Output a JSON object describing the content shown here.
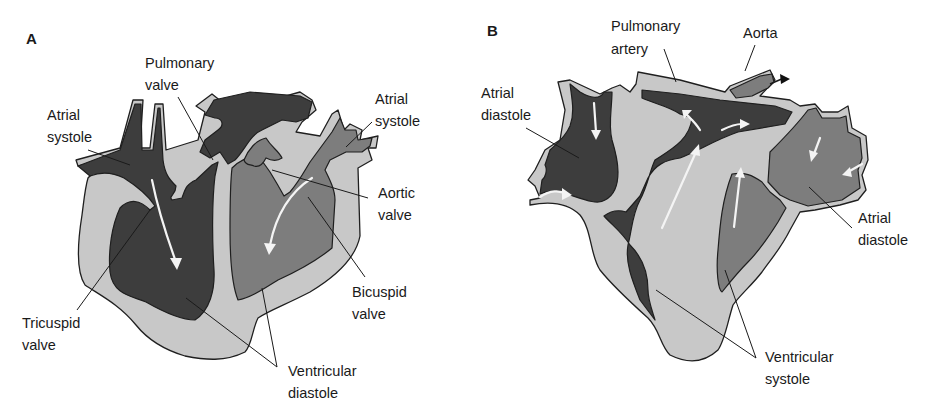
{
  "figure": {
    "colors": {
      "background": "#ffffff",
      "wall": "#c8c8c8",
      "deoxygenated_chamber": "#3d3d3d",
      "oxygenated_chamber": "#7d7d7d",
      "flow_arrow": "#f4f4f4",
      "outline": "#1f1f1f",
      "text": "#1a1a1a"
    }
  },
  "panels": [
    {
      "id": "A",
      "letter": "A",
      "labels": {
        "pulmonary_valve": [
          "Pulmonary",
          "valve"
        ],
        "atrial_systole_left": [
          "Atrial",
          "systole"
        ],
        "atrial_systole_right": [
          "Atrial",
          "systole"
        ],
        "aortic_valve": [
          "Aortic",
          "valve"
        ],
        "bicuspid_valve": [
          "Bicuspid",
          "valve"
        ],
        "tricuspid_valve": [
          "Tricuspid",
          "valve"
        ],
        "ventricular_diastole": [
          "Ventricular",
          "diastole"
        ]
      }
    },
    {
      "id": "B",
      "letter": "B",
      "labels": {
        "pulmonary_artery": [
          "Pulmonary",
          "artery"
        ],
        "aorta": [
          "Aorta"
        ],
        "atrial_diastole_left": [
          "Atrial",
          "diastole"
        ],
        "atrial_diastole_right": [
          "Atrial",
          "diastole"
        ],
        "ventricular_systole": [
          "Ventricular",
          "systole"
        ]
      }
    }
  ]
}
